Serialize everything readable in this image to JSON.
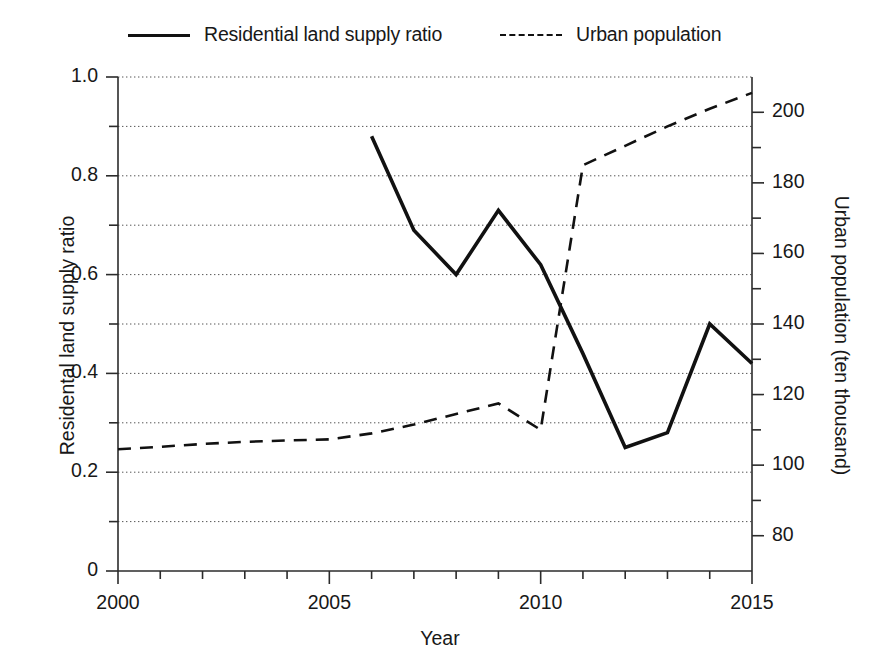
{
  "chart_data": {
    "type": "line",
    "title": "",
    "xlabel": "Year",
    "ylabel": "Residential land supply ratio",
    "y2label": "Urban population (ten thousand)",
    "xlim": [
      2000,
      2015
    ],
    "ylim": [
      0,
      1.0
    ],
    "y2lim": [
      70,
      210
    ],
    "grid": true,
    "legend_position": "top",
    "xticks": [
      2000,
      2005,
      2010,
      2015
    ],
    "xtick_labels": [
      "2000",
      "2005",
      "2010",
      "2015"
    ],
    "xminor_step": 1,
    "yticks": [
      0,
      0.2,
      0.4,
      0.6,
      0.8,
      1.0
    ],
    "ytick_labels": [
      "0",
      "0.2",
      "0.4",
      "0.6",
      "0.8",
      "1.0"
    ],
    "yminor": [
      0.1,
      0.3,
      0.5,
      0.7,
      0.9
    ],
    "y2ticks": [
      80,
      100,
      120,
      140,
      160,
      180,
      200
    ],
    "y2tick_labels": [
      "80",
      "100",
      "120",
      "140",
      "160",
      "180",
      "200"
    ],
    "y2minor": [
      90,
      110,
      130,
      150,
      170,
      190
    ],
    "series": [
      {
        "name": "Residential land supply ratio",
        "axis": "left",
        "style": "solid",
        "color": "#111111",
        "x": [
          2006,
          2007,
          2008,
          2009,
          2010,
          2011,
          2012,
          2013,
          2014,
          2015
        ],
        "values": [
          0.88,
          0.69,
          0.6,
          0.73,
          0.62,
          0.44,
          0.25,
          0.28,
          0.5,
          0.42
        ]
      },
      {
        "name": "Urban population",
        "axis": "right",
        "style": "dashed",
        "color": "#111111",
        "x": [
          2000,
          2001,
          2002,
          2003,
          2004,
          2005,
          2006,
          2007,
          2008,
          2009,
          2010,
          2011,
          2012,
          2013,
          2014,
          2015
        ],
        "values": [
          104.5,
          105.2,
          106.0,
          106.6,
          107.0,
          107.3,
          109.0,
          111.5,
          114.5,
          117.5,
          110.0,
          185.0,
          190.5,
          196.0,
          201.0,
          205.5
        ]
      }
    ]
  },
  "legend": {
    "entries": [
      {
        "label": "Residential land supply ratio",
        "style": "solid"
      },
      {
        "label": "Urban population",
        "style": "dashed"
      }
    ]
  },
  "axes": {
    "x_title": "Year",
    "y_left_title": "Residental land supply ratio",
    "y_right_title": "Urban population (ten thousand)"
  }
}
